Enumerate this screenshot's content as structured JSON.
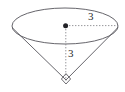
{
  "figure": {
    "name": "cone-with-dimensions",
    "background_color": "#ffffff",
    "stroke_color": "#55545a",
    "dash_color": "#8a8a90",
    "label_color": "#2b2b2b",
    "labels": {
      "radius": "3",
      "height": "3"
    },
    "geometry": {
      "ellipse_center_x": 65,
      "ellipse_center_y": 26,
      "ellipse_rx": 53,
      "ellipse_ry": 18,
      "apex_x": 66,
      "apex_y": 80,
      "radius_end_x": 118,
      "radius_end_y": 26,
      "right_angle_marker": "square"
    }
  }
}
